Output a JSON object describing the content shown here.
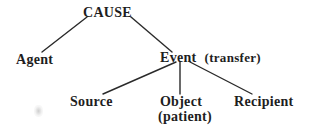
{
  "diagram": {
    "type": "tree",
    "root": {
      "label": "CAUSE",
      "children": [
        "agent",
        "event"
      ]
    },
    "nodes": {
      "cause": {
        "label": "CAUSE"
      },
      "agent": {
        "label": "Agent"
      },
      "event": {
        "label": "Event",
        "annotation": "(transfer)"
      },
      "source": {
        "label": "Source"
      },
      "object": {
        "label": "Object",
        "annotation": "(patient)"
      },
      "recipient": {
        "label": "Recipient"
      }
    },
    "edges": [
      {
        "from": "cause",
        "to": "agent"
      },
      {
        "from": "cause",
        "to": "event"
      },
      {
        "from": "event",
        "to": "source"
      },
      {
        "from": "event",
        "to": "object"
      },
      {
        "from": "event",
        "to": "recipient"
      }
    ],
    "colors": {
      "text": "#1e1e1e",
      "line": "#2a2a2a",
      "background": "#ffffff"
    }
  }
}
